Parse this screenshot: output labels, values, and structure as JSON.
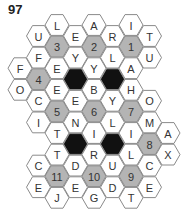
{
  "puzzle": {
    "number": "97",
    "colors": {
      "letter_fill": "#ffffff",
      "number_fill": "#b4b4b4",
      "blocked_fill": "#111111",
      "stroke": "#8a8a8a",
      "text": "#333333"
    },
    "grid": {
      "col_x": [
        20,
        38.5,
        57,
        75.5,
        94,
        112.5,
        131,
        149.5,
        168
      ],
      "even_col_y0": 25,
      "odd_col_y0": 36,
      "row_step": 21.6,
      "hex_radius": 12
    },
    "cells": [
      {
        "col": 0,
        "row": 2,
        "type": "letter",
        "text": "F"
      },
      {
        "col": 0,
        "row": 3,
        "type": "letter",
        "text": "O"
      },
      {
        "col": 1,
        "row": 0,
        "type": "letter",
        "text": "U"
      },
      {
        "col": 1,
        "row": 1,
        "type": "letter",
        "text": "F"
      },
      {
        "col": 1,
        "row": 2,
        "type": "number",
        "text": "4"
      },
      {
        "col": 1,
        "row": 3,
        "type": "letter",
        "text": "C"
      },
      {
        "col": 1,
        "row": 4,
        "type": "letter",
        "text": "I"
      },
      {
        "col": 1,
        "row": 6,
        "type": "letter",
        "text": "C"
      },
      {
        "col": 1,
        "row": 7,
        "type": "letter",
        "text": "E"
      },
      {
        "col": 2,
        "row": 0,
        "type": "letter",
        "text": "L"
      },
      {
        "col": 2,
        "row": 1,
        "type": "number",
        "text": "3"
      },
      {
        "col": 2,
        "row": 2,
        "type": "letter",
        "text": "E"
      },
      {
        "col": 2,
        "row": 3,
        "type": "letter",
        "text": "E"
      },
      {
        "col": 2,
        "row": 4,
        "type": "number",
        "text": "5"
      },
      {
        "col": 2,
        "row": 5,
        "type": "letter",
        "text": "T"
      },
      {
        "col": 2,
        "row": 6,
        "type": "letter",
        "text": "T"
      },
      {
        "col": 2,
        "row": 7,
        "type": "number",
        "text": "11"
      },
      {
        "col": 2,
        "row": 8,
        "type": "letter",
        "text": "J"
      },
      {
        "col": 3,
        "row": 0,
        "type": "letter",
        "text": "E"
      },
      {
        "col": 3,
        "row": 1,
        "type": "letter",
        "text": "Y"
      },
      {
        "col": 3,
        "row": 2,
        "type": "blocked",
        "text": ""
      },
      {
        "col": 3,
        "row": 3,
        "type": "letter",
        "text": "E"
      },
      {
        "col": 3,
        "row": 4,
        "type": "letter",
        "text": "N"
      },
      {
        "col": 3,
        "row": 5,
        "type": "blocked",
        "text": ""
      },
      {
        "col": 3,
        "row": 6,
        "type": "letter",
        "text": "D"
      },
      {
        "col": 3,
        "row": 7,
        "type": "letter",
        "text": "E"
      },
      {
        "col": 4,
        "row": 0,
        "type": "letter",
        "text": "A"
      },
      {
        "col": 4,
        "row": 1,
        "type": "number",
        "text": "2"
      },
      {
        "col": 4,
        "row": 2,
        "type": "letter",
        "text": "Y"
      },
      {
        "col": 4,
        "row": 3,
        "type": "letter",
        "text": "B"
      },
      {
        "col": 4,
        "row": 4,
        "type": "number",
        "text": "6"
      },
      {
        "col": 4,
        "row": 5,
        "type": "letter",
        "text": "I"
      },
      {
        "col": 4,
        "row": 6,
        "type": "letter",
        "text": "R"
      },
      {
        "col": 4,
        "row": 7,
        "type": "number",
        "text": "10"
      },
      {
        "col": 4,
        "row": 8,
        "type": "letter",
        "text": "G"
      },
      {
        "col": 5,
        "row": 0,
        "type": "letter",
        "text": "R"
      },
      {
        "col": 5,
        "row": 1,
        "type": "letter",
        "text": "L"
      },
      {
        "col": 5,
        "row": 2,
        "type": "blocked",
        "text": ""
      },
      {
        "col": 5,
        "row": 3,
        "type": "letter",
        "text": "Y"
      },
      {
        "col": 5,
        "row": 4,
        "type": "letter",
        "text": "L"
      },
      {
        "col": 5,
        "row": 5,
        "type": "blocked",
        "text": ""
      },
      {
        "col": 5,
        "row": 6,
        "type": "letter",
        "text": "U"
      },
      {
        "col": 5,
        "row": 7,
        "type": "letter",
        "text": "D"
      },
      {
        "col": 6,
        "row": 0,
        "type": "letter",
        "text": "I"
      },
      {
        "col": 6,
        "row": 1,
        "type": "number",
        "text": "1"
      },
      {
        "col": 6,
        "row": 2,
        "type": "letter",
        "text": "A"
      },
      {
        "col": 6,
        "row": 3,
        "type": "letter",
        "text": "H"
      },
      {
        "col": 6,
        "row": 4,
        "type": "number",
        "text": "7"
      },
      {
        "col": 6,
        "row": 5,
        "type": "letter",
        "text": "I"
      },
      {
        "col": 6,
        "row": 6,
        "type": "letter",
        "text": "L"
      },
      {
        "col": 6,
        "row": 7,
        "type": "number",
        "text": "9"
      },
      {
        "col": 6,
        "row": 8,
        "type": "letter",
        "text": "T"
      },
      {
        "col": 7,
        "row": 0,
        "type": "letter",
        "text": "T"
      },
      {
        "col": 7,
        "row": 1,
        "type": "letter",
        "text": "U"
      },
      {
        "col": 7,
        "row": 3,
        "type": "letter",
        "text": "O"
      },
      {
        "col": 7,
        "row": 4,
        "type": "letter",
        "text": "M"
      },
      {
        "col": 7,
        "row": 5,
        "type": "number",
        "text": "8"
      },
      {
        "col": 7,
        "row": 6,
        "type": "letter",
        "text": "C"
      },
      {
        "col": 7,
        "row": 7,
        "type": "letter",
        "text": "E"
      },
      {
        "col": 8,
        "row": 5,
        "type": "letter",
        "text": "A"
      },
      {
        "col": 8,
        "row": 6,
        "type": "letter",
        "text": "X"
      }
    ]
  }
}
